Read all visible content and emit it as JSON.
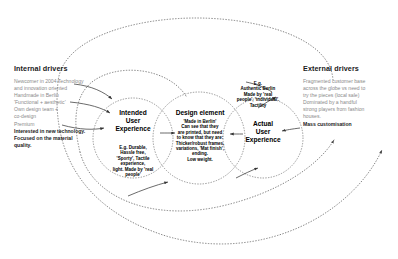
{
  "diagram": {
    "type": "causal-loop-diagram",
    "background": "#ffffff",
    "ink": "#000000",
    "muted_text": "#8a8a8a"
  },
  "internal_drivers": {
    "title": "Internal drivers",
    "lines": [
      "Newcomer in 2004 Technology",
      "and innovation oriented",
      "Handmade in Berlin",
      "'Functional + aesthetic'",
      "Own design team +",
      "co-design",
      "Premium"
    ],
    "emphasis_lines": [
      "Interested in new technology.",
      "Focused on the material",
      "quality."
    ]
  },
  "external_drivers": {
    "title": "External drivers",
    "lines": [
      "Fragmented customer base",
      "across the globe vs need to",
      "try the pieces (local sale)",
      "Dominated by a handful",
      "strong players from fashion",
      "houses."
    ],
    "emphasis_lines": [
      "Mass customisation"
    ]
  },
  "nodes": {
    "intended": {
      "title": "Intended\nUser\nExperience",
      "examples": "E.g. Durable,\nHassle free,\n'Sporty', Tactile\nexperience,\nlight. Made by 'real\npeople'"
    },
    "design_element": {
      "title": "Design element",
      "examples": "'Made in Berlin'\nCan see that they\nare printed, but need\nto know that they are:\nThicker/robust frames,\nvariations, 'Mat finish',\nending.\nLow weight."
    },
    "actual": {
      "title": "Actual\nUser\nExperience",
      "examples": "E.g.\nAuthentic Berlin\nMade by 'real\npeople', 'individual'.\nTactility"
    }
  }
}
